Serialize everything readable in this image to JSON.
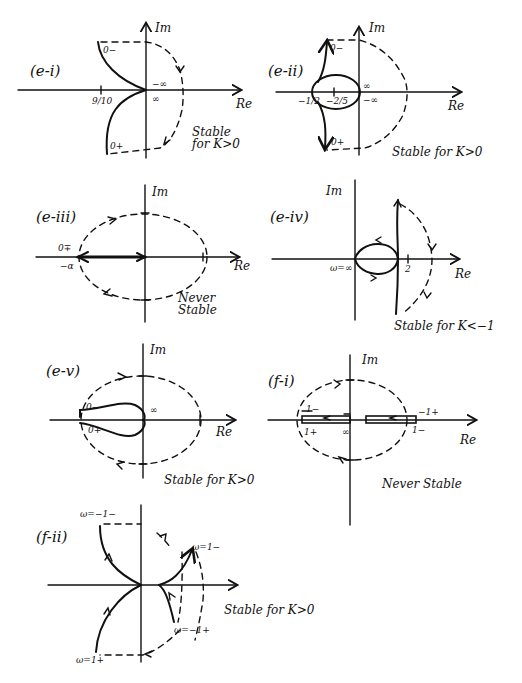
{
  "page": {
    "background": "#ffffff",
    "ink": "#111111"
  },
  "panels": [
    {
      "id": "e-i",
      "label": "(e-i)",
      "axes": {
        "x": "Re",
        "y": "Im"
      },
      "ticks": {
        "real": "9/10",
        "top": "−∞",
        "bottom": "∞"
      },
      "freq": {
        "start": "0−",
        "end": "0+"
      },
      "stability": "Stable for K>0"
    },
    {
      "id": "e-ii",
      "label": "(e-ii)",
      "axes": {
        "x": "Re",
        "y": "Im"
      },
      "ticks": {
        "left": "−1/2",
        "mid": "−2/5",
        "top": "∞",
        "bottom": "−∞"
      },
      "freq": {
        "start": "0−",
        "end": "0+"
      },
      "stability": "Stable for K>0"
    },
    {
      "id": "e-iii",
      "label": "(e-iii)",
      "axes": {
        "x": "Re",
        "y": "Im"
      },
      "ticks": {
        "left_freq": "0∓",
        "left": "−α"
      },
      "stability": "Never Stable"
    },
    {
      "id": "e-iv",
      "label": "(e-iv)",
      "axes": {
        "x": "Re",
        "y": "Im"
      },
      "ticks": {
        "origin": "ω=∞",
        "real": "2"
      },
      "stability": "Stable for K<−1"
    },
    {
      "id": "e-v",
      "label": "(e-v)",
      "axes": {
        "x": "Re",
        "y": "Im"
      },
      "ticks": {
        "origin": "∞"
      },
      "freq": {
        "start": "0−",
        "end": "0+"
      },
      "stability": "Stable for K>0"
    },
    {
      "id": "f-i",
      "label": "(f-i)",
      "axes": {
        "x": "Re",
        "y": "Im"
      },
      "ticks": {
        "left_top": "1−",
        "left_bottom": "1+",
        "origin": "∞",
        "right_top": "−1+",
        "right_bottom": "1−"
      },
      "stability": "Never Stable"
    },
    {
      "id": "f-ii",
      "label": "(f-ii)",
      "axes": {
        "x": "",
        "y": ""
      },
      "ticks": {
        "top_left": "ω=−1−",
        "right_top": "ω=1−",
        "right_bottom": "ω=−1+",
        "bottom_left": "ω=1+"
      },
      "stability": "Stable for K>0"
    }
  ]
}
